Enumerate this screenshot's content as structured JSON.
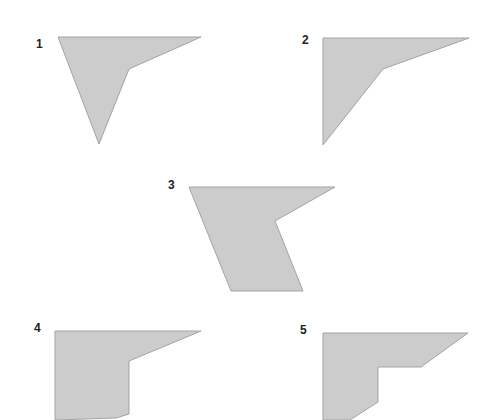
{
  "colors": {
    "fill": "#cccccc",
    "stroke": "#a3a3a3",
    "label": "#222222",
    "background": "#ffffff"
  },
  "shapes": [
    {
      "label": "1",
      "label_pos": [
        36,
        48
      ],
      "points": "58,37 201,37 129,69 99,144"
    },
    {
      "label": "2",
      "label_pos": [
        302,
        44
      ],
      "points": "323,38 469,38 383,69 323,145"
    },
    {
      "label": "3",
      "label_pos": [
        168,
        189
      ],
      "points": "189,187 335,187 275,221 303,291 231,291"
    },
    {
      "label": "4",
      "label_pos": [
        34,
        332
      ],
      "points": "55,331 201,331 129,361 129,414 116,418 55,420"
    },
    {
      "label": "5",
      "label_pos": [
        300,
        334
      ],
      "points": "323,333 468,333 421,367 378,367 378,402 350,420 323,420"
    }
  ]
}
